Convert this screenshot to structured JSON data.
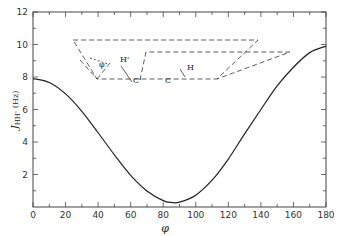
{
  "chart_data": {
    "type": "line",
    "title": "",
    "xlabel": "φ",
    "ylabel": "J_HH' (Hz)",
    "ylabel_main": "J",
    "ylabel_sub": "HH'",
    "ylabel_unit": "(Hz)",
    "xlim": [
      0,
      180
    ],
    "ylim": [
      0,
      12
    ],
    "grid": false,
    "legend": null,
    "x_ticks": [
      0,
      20,
      40,
      60,
      80,
      100,
      120,
      140,
      160,
      180
    ],
    "y_ticks": [
      2,
      4,
      6,
      8,
      10,
      12
    ],
    "series": [
      {
        "name": "Karplus curve",
        "x": [
          0,
          10,
          20,
          30,
          40,
          50,
          60,
          70,
          80,
          85,
          90,
          100,
          110,
          120,
          130,
          140,
          150,
          160,
          170,
          180
        ],
        "values": [
          7.9,
          7.66,
          6.96,
          5.89,
          4.57,
          3.21,
          1.95,
          0.99,
          0.39,
          0.28,
          0.3,
          0.73,
          1.65,
          2.95,
          4.5,
          6.0,
          7.45,
          8.6,
          9.5,
          9.9
        ]
      }
    ],
    "inset": {
      "description": "Dihedral angle diagram between H-C and C'-H' planes",
      "labels": [
        "φ",
        "H'",
        "C'",
        "C",
        "H"
      ]
    }
  }
}
